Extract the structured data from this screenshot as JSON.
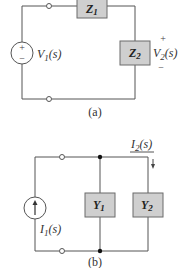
{
  "circuit_a": {
    "caption": "(a)",
    "source_label": "V",
    "source_sub": "1",
    "source_arg": "(s)",
    "source_plus": "+",
    "source_minus": "−",
    "z1_label": "Z",
    "z1_sub": "1",
    "z2_label": "Z",
    "z2_sub": "2",
    "output_label": "V",
    "output_sub": "2",
    "output_arg": "(s)",
    "output_plus": "+",
    "output_minus": "−"
  },
  "circuit_b": {
    "caption": "(b)",
    "source_label": "I",
    "source_sub": "1",
    "source_arg": "(s)",
    "y1_label": "Y",
    "y1_sub": "1",
    "y2_label": "Y",
    "y2_sub": "2",
    "current_label": "I",
    "current_sub": "2",
    "current_arg": "(s)"
  },
  "colors": {
    "box_fill": "#cfcfcf",
    "wire": "#555555"
  }
}
